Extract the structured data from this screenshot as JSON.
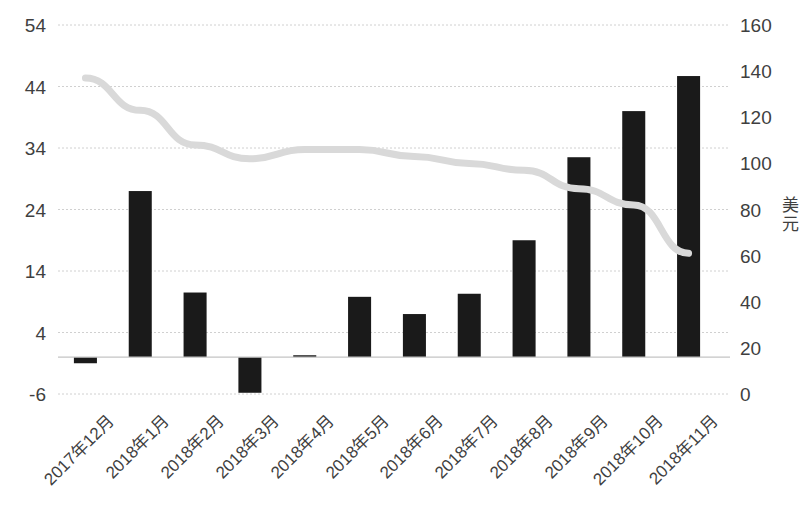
{
  "chart_data": {
    "type": "bar",
    "title": "",
    "subtitle": "",
    "xlabel": "",
    "ylabel": "",
    "categories": [
      "2017年12月",
      "2018年1月",
      "2018年2月",
      "2018年3月",
      "2018年4月",
      "2018年5月",
      "2018年6月",
      "2018年7月",
      "2018年8月",
      "2018年9月",
      "2018年10月",
      "2018年11月"
    ],
    "series": [
      {
        "name": "bar-series",
        "chart_type": "bar",
        "axis": "left",
        "color": "#1a1a1a",
        "values": [
          -1,
          27,
          10.5,
          -5.8,
          0.3,
          9.8,
          7,
          10.3,
          19,
          32.5,
          40,
          45.7
        ]
      },
      {
        "name": "line-series",
        "chart_type": "line",
        "axis": "right",
        "color": "#d9d9d9",
        "values": [
          137,
          123,
          108,
          102,
          106,
          106,
          103,
          100,
          97,
          89,
          82,
          61
        ]
      }
    ],
    "left_axis": {
      "ticks": [
        54,
        44,
        34,
        24,
        14,
        4,
        -6
      ],
      "min": -6,
      "max": 54,
      "step": 10,
      "unit": ""
    },
    "right_axis": {
      "ticks": [
        160,
        140,
        120,
        100,
        80,
        60,
        40,
        20,
        0
      ],
      "min": 0,
      "max": 160,
      "step": 20,
      "unit": "美元"
    },
    "grid": true,
    "gridline_color": "#d0d0d0",
    "legend": "none",
    "background": "#ffffff"
  }
}
